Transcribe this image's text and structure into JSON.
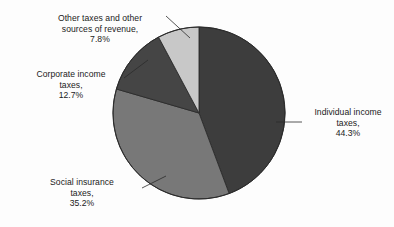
{
  "chart_data": {
    "type": "pie",
    "title": "",
    "subtitle": "",
    "xlabel": "",
    "ylabel": "",
    "legend_position": "none",
    "grid": false,
    "start_angle_deg": 0,
    "direction": "clockwise",
    "categories": [
      "Individual income taxes",
      "Social insurance taxes",
      "Corporate income taxes",
      "Other taxes and other sources of revenue"
    ],
    "values": [
      44.3,
      35.2,
      12.7,
      7.8
    ],
    "value_unit": "%",
    "colors": [
      "#3d3d3d",
      "#787878",
      "#454545",
      "#c8c8c8"
    ],
    "slices": [
      {
        "name": "Individual income taxes",
        "value": 44.3,
        "color": "#3d3d3d",
        "label_text": "Individual income\ntaxes,\n44.3%",
        "label_position": "right"
      },
      {
        "name": "Social insurance taxes",
        "value": 35.2,
        "color": "#787878",
        "label_text": "Social insurance\ntaxes,\n35.2%",
        "label_position": "bottom-left"
      },
      {
        "name": "Corporate income taxes",
        "value": 12.7,
        "color": "#454545",
        "label_text": "Corporate income\ntaxes,\n12.7%",
        "label_position": "left"
      },
      {
        "name": "Other taxes and other sources of revenue",
        "value": 7.8,
        "color": "#c8c8c8",
        "label_text": "Other taxes and other\nsources of revenue,\n7.8%",
        "label_position": "top-left"
      }
    ]
  },
  "labels": {
    "individual": "Individual income\ntaxes,\n44.3%",
    "social": "Social insurance\ntaxes,\n35.2%",
    "corporate": "Corporate income\ntaxes,\n12.7%",
    "other": "Other taxes and other\nsources of revenue,\n7.8%"
  },
  "style": {
    "background": "#fdfdfd",
    "outline": "#2b2b2b",
    "leader_line": "#2b2b2b",
    "text_color": "#1b1b1b"
  },
  "geometry": {
    "center_x": 199,
    "center_y": 113,
    "radius": 86
  }
}
